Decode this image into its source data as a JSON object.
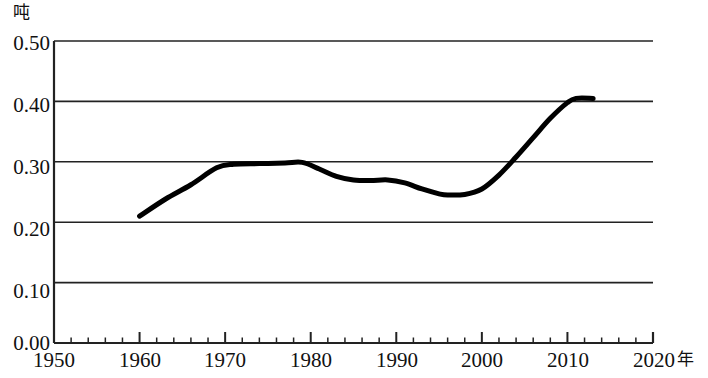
{
  "chart_data": {
    "type": "line",
    "title": "",
    "xlabel": "年",
    "ylabel": "吨",
    "y_unit": "吨",
    "x_unit": "年",
    "xlim": [
      1950,
      2020
    ],
    "ylim": [
      0.0,
      0.5
    ],
    "grid": true,
    "legend": "none",
    "x_ticks": [
      1950,
      1960,
      1970,
      1980,
      1990,
      2000,
      2010,
      2020
    ],
    "x_tick_labels": [
      "1950",
      "1960",
      "1970",
      "1980",
      "1990",
      "2000",
      "2010",
      "2020"
    ],
    "x_minor_tick_step": 2,
    "y_ticks": [
      0.0,
      0.1,
      0.2,
      0.3,
      0.4,
      0.5
    ],
    "y_tick_labels": [
      "0.00",
      "0.10",
      "0.20",
      "0.30",
      "0.40",
      "0.50"
    ],
    "series": [
      {
        "name": "人均量",
        "color": "#000000",
        "line_width": 5,
        "x": [
          1960,
          1963,
          1966,
          1969,
          1971,
          1974,
          1977,
          1979,
          1981,
          1983,
          1985,
          1987,
          1989,
          1991,
          1993,
          1995,
          1996,
          1998,
          2000,
          2002,
          2004,
          2006,
          2008,
          2010,
          2011,
          2013
        ],
        "values": [
          0.21,
          0.238,
          0.262,
          0.29,
          0.296,
          0.297,
          0.298,
          0.299,
          0.288,
          0.276,
          0.27,
          0.269,
          0.27,
          0.265,
          0.255,
          0.247,
          0.245,
          0.246,
          0.255,
          0.278,
          0.308,
          0.34,
          0.372,
          0.398,
          0.405,
          0.405
        ]
      }
    ]
  },
  "axis": {
    "y_labels": [
      "0.50",
      "0.40",
      "0.30",
      "0.20",
      "0.10",
      "0.00"
    ],
    "x_labels": [
      "1950",
      "1960",
      "1970",
      "1980",
      "1990",
      "2000",
      "2010",
      "2020"
    ],
    "y_unit_label": "吨",
    "x_unit_label": "年"
  }
}
